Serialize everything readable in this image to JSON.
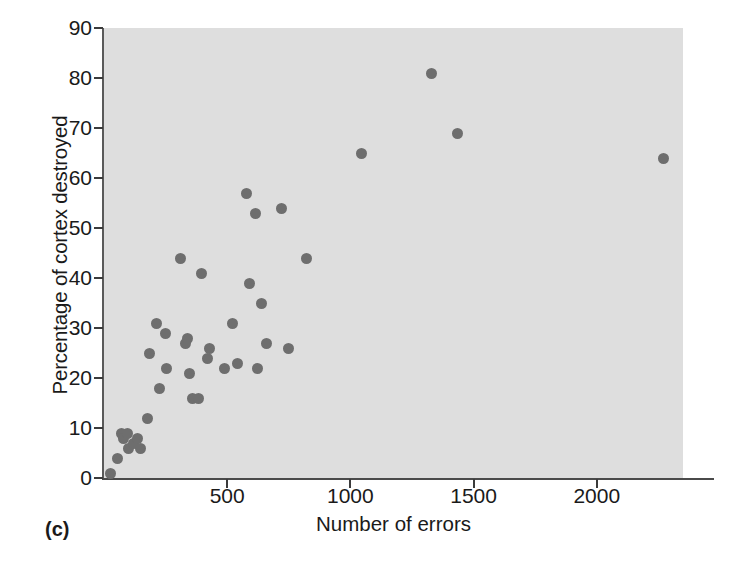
{
  "figure": {
    "panel_letter": "(c)",
    "background_color": "#dedede",
    "marker_color": "#6e6e6e"
  },
  "chart_data": {
    "type": "scatter",
    "title": "",
    "xlabel": "Number of errors",
    "ylabel": "Percentage of cortex destroyed",
    "xlim": [
      0,
      2350
    ],
    "ylim": [
      0,
      90
    ],
    "xticks": [
      500,
      1000,
      1500,
      2000
    ],
    "yticks": [
      0,
      10,
      20,
      30,
      40,
      50,
      60,
      70,
      80,
      90
    ],
    "grid": false,
    "legend": null,
    "series": [
      {
        "name": "Rats",
        "points": [
          [
            25,
            1
          ],
          [
            55,
            4
          ],
          [
            70,
            9
          ],
          [
            80,
            8
          ],
          [
            95,
            9
          ],
          [
            100,
            6
          ],
          [
            120,
            7
          ],
          [
            135,
            8
          ],
          [
            150,
            6
          ],
          [
            175,
            12
          ],
          [
            185,
            25
          ],
          [
            215,
            31
          ],
          [
            225,
            18
          ],
          [
            250,
            29
          ],
          [
            255,
            22
          ],
          [
            310,
            44
          ],
          [
            330,
            27
          ],
          [
            340,
            28
          ],
          [
            345,
            21
          ],
          [
            360,
            16
          ],
          [
            385,
            16
          ],
          [
            395,
            41
          ],
          [
            420,
            24
          ],
          [
            430,
            26
          ],
          [
            490,
            22
          ],
          [
            520,
            31
          ],
          [
            540,
            23
          ],
          [
            580,
            57
          ],
          [
            590,
            39
          ],
          [
            615,
            53
          ],
          [
            625,
            22
          ],
          [
            640,
            35
          ],
          [
            660,
            27
          ],
          [
            720,
            54
          ],
          [
            750,
            26
          ],
          [
            820,
            44
          ],
          [
            1045,
            65
          ],
          [
            1330,
            81
          ],
          [
            1435,
            69
          ],
          [
            2270,
            64
          ]
        ]
      }
    ]
  }
}
